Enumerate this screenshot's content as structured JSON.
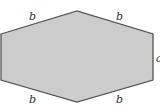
{
  "diagram": {
    "shape": "hexagon",
    "fill_color": "#cccccc",
    "stroke_color": "#555555",
    "vertices": [
      [
        1,
        34
      ],
      [
        77,
        11
      ],
      [
        153,
        34
      ],
      [
        153,
        80
      ],
      [
        77,
        102
      ],
      [
        1,
        80
      ]
    ],
    "labels": {
      "top_left_edge": "b",
      "top_right_edge": "b",
      "right_edge": "a",
      "bottom_left_edge": "b",
      "bottom_right_edge": "b"
    }
  }
}
